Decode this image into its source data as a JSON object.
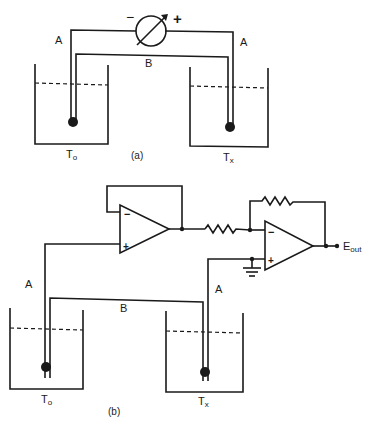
{
  "figure_a": {
    "caption": "(a)",
    "meter": {
      "minus": "−",
      "plus": "+"
    },
    "wire_a_left": "A",
    "wire_a_right": "A",
    "wire_b": "B",
    "left_bath": {
      "label": "T",
      "subscript": "o"
    },
    "right_bath": {
      "label": "T",
      "subscript": "x"
    }
  },
  "figure_b": {
    "caption": "(b)",
    "wire_a_left": "A",
    "wire_a_right": "A",
    "wire_b": "B",
    "opamp1": {
      "minus": "−",
      "plus": "+"
    },
    "opamp2": {
      "minus": "−",
      "plus": "+"
    },
    "output": {
      "label": "E",
      "subscript": "out"
    },
    "left_bath": {
      "label": "T",
      "subscript": "o"
    },
    "right_bath": {
      "label": "T",
      "subscript": "x"
    }
  }
}
